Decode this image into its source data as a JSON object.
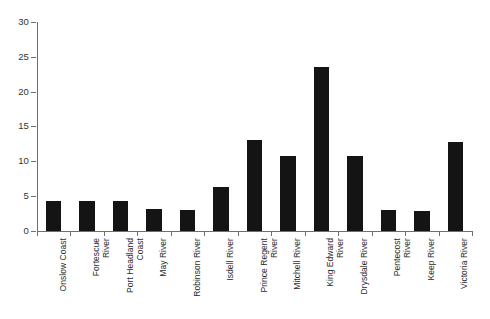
{
  "chart_data": {
    "type": "bar",
    "title": "",
    "subtitle": "",
    "xlabel": "",
    "ylabel": "",
    "ylim": [
      0,
      30
    ],
    "yticks": [
      0,
      5,
      10,
      15,
      20,
      25,
      30
    ],
    "ytick_labels": [
      "0",
      "5",
      "10",
      "15",
      "20",
      "25",
      "30"
    ],
    "grid": false,
    "legend": null,
    "bar_color": "#141414",
    "axis_color": "#6f6f6f",
    "categories": [
      "Onslow Coast",
      "Fortescue River",
      "Port Headland Coast",
      "May River",
      "Robinson River",
      "Isdell River",
      "Prince Regent River",
      "Mitchell River",
      "King Edward River",
      "Drysdale River",
      "Pentecost River",
      "Keep River",
      "Victoria River"
    ],
    "category_label_lines": [
      "Onslow Coast",
      "Fortescue\nRiver",
      "Port Headland\nCoast",
      "May River",
      "Robinson River",
      "Isdell River",
      "Prince Regent\nRiver",
      "Mitchell River",
      "King Edward\nRiver",
      "Drysdale River",
      "Pentecost\nRiver",
      "Keep River",
      "Victoria River"
    ],
    "values": [
      4.3,
      4.3,
      4.3,
      3.1,
      3.0,
      6.3,
      13.0,
      10.7,
      23.5,
      10.7,
      2.9,
      2.8,
      12.7
    ]
  }
}
